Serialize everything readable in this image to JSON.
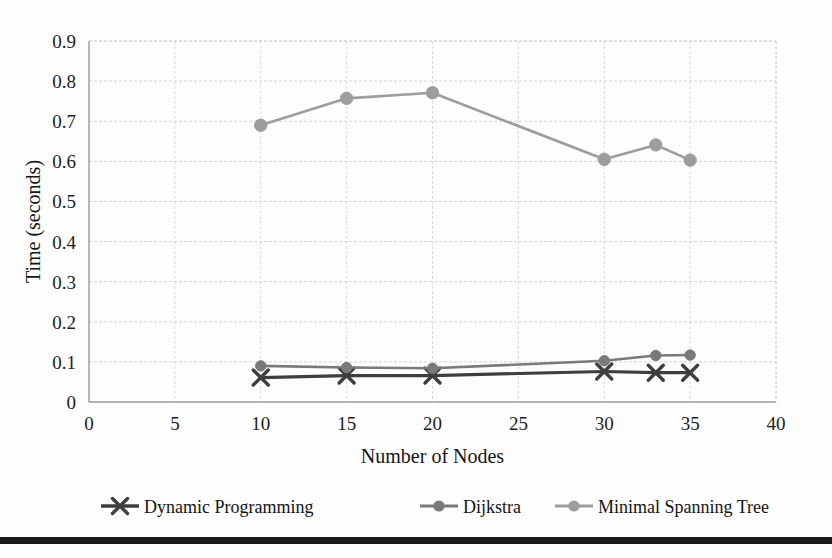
{
  "chart_data": {
    "type": "line",
    "title": "",
    "xlabel": "Number of Nodes",
    "ylabel": "Time (seconds)",
    "xlim": [
      0,
      40
    ],
    "ylim": [
      0,
      0.9
    ],
    "xticks": [
      "0",
      "5",
      "10",
      "15",
      "20",
      "25",
      "30",
      "35",
      "40"
    ],
    "xtick_values": [
      0,
      5,
      10,
      15,
      20,
      25,
      30,
      35,
      40
    ],
    "yticks": [
      "0",
      "0.1",
      "0.2",
      "0.3",
      "0.4",
      "0.5",
      "0.6",
      "0.7",
      "0.8",
      "0.9"
    ],
    "ytick_values": [
      0,
      0.1,
      0.2,
      0.3,
      0.4,
      0.5,
      0.6,
      0.7,
      0.8,
      0.9
    ],
    "grid": true,
    "legend_position": "bottom",
    "x": [
      10,
      15,
      20,
      30,
      33,
      35
    ],
    "series": [
      {
        "name": "Dynamic Programming",
        "marker": "x",
        "color": "#3f3f3f",
        "values": [
          0.061,
          0.066,
          0.066,
          0.076,
          0.073,
          0.073
        ]
      },
      {
        "name": "Dijkstra",
        "marker": "circle",
        "color": "#7a7a7a",
        "values": [
          0.09,
          0.086,
          0.084,
          0.103,
          0.116,
          0.117
        ]
      },
      {
        "name": "Minimal Spanning Tree",
        "marker": "circle",
        "color": "#9e9e9e",
        "values": [
          0.69,
          0.757,
          0.771,
          0.605,
          0.641,
          0.603
        ]
      }
    ],
    "upper_series_index": 2
  },
  "legend": {
    "entries": [
      {
        "label": "Dynamic Programming",
        "marker": "x-marker-icon",
        "color": "#3f3f3f"
      },
      {
        "label": "Dijkstra",
        "marker": "circle-marker-icon",
        "color": "#7a7a7a"
      },
      {
        "label": "Minimal Spanning Tree",
        "marker": "circle-marker-icon",
        "color": "#9e9e9e"
      }
    ]
  },
  "axes": {
    "x_title": "Number of Nodes",
    "y_title": "Time (seconds)"
  },
  "colors": {
    "background": "#ffffff",
    "grid": "#cfcfcf",
    "axis": "#9a9a9a",
    "text": "#1a1a1a",
    "rule": "#1a1a1a"
  }
}
